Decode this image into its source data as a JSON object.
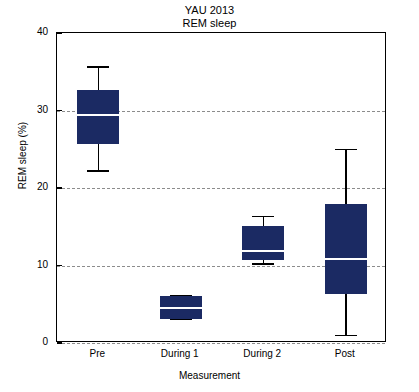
{
  "chart_data": {
    "type": "box",
    "title": "YAU 2013",
    "subtitle": "REM sleep",
    "xlabel": "Measurement",
    "ylabel": "REM sleep (%)",
    "categories": [
      "Pre",
      "During 1",
      "During 2",
      "Post"
    ],
    "ylim": [
      0,
      40
    ],
    "yticks": [
      0,
      10,
      20,
      30,
      40
    ],
    "ytick_labels": [
      "0",
      "10",
      "20",
      "30",
      "40"
    ],
    "grid": "horizontal dashed at 0, 10, 20, 30",
    "legend": "none",
    "box_color": "#1b2a63",
    "median_color": "#ffffff",
    "grid_color": "#8c8c8c",
    "boxes": [
      {
        "category": "Pre",
        "whisker_low": 22.2,
        "q1": 25.7,
        "median": 29.4,
        "q3": 32.7,
        "whisker_high": 35.6
      },
      {
        "category": "During 1",
        "whisker_low": 3.1,
        "q1": 3.1,
        "median": 4.5,
        "q3": 6.1,
        "whisker_high": 6.1
      },
      {
        "category": "During 2",
        "whisker_low": 10.2,
        "q1": 10.7,
        "median": 11.9,
        "q3": 15.1,
        "whisker_high": 16.3
      },
      {
        "category": "Post",
        "whisker_low": 1.0,
        "q1": 6.3,
        "median": 10.8,
        "q3": 17.9,
        "whisker_high": 25.0
      }
    ]
  }
}
